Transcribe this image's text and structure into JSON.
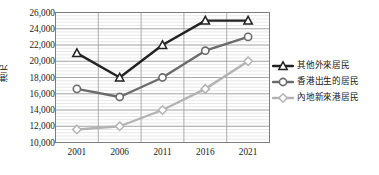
{
  "chart_data": {
    "type": "line",
    "title": "",
    "xlabel": "",
    "ylabel": "港元",
    "categories": [
      "2001",
      "2006",
      "2011",
      "2016",
      "2021"
    ],
    "ylim": [
      10000,
      26000
    ],
    "ytick_step": 2000,
    "yticks": [
      "26,000",
      "24,000",
      "22,000",
      "20,000",
      "18,000",
      "16,000",
      "14,000",
      "12,000",
      "10,000"
    ],
    "ytick_values": [
      26000,
      24000,
      22000,
      20000,
      18000,
      16000,
      14000,
      12000,
      10000
    ],
    "grid": true,
    "minor_grid": true,
    "legend_position": "right",
    "series": [
      {
        "name": "其他外來居民",
        "color": "#222222",
        "marker": "triangle",
        "values": [
          21000,
          18000,
          22000,
          25000,
          25000
        ]
      },
      {
        "name": "香港出生的居民",
        "color": "#6b6b6b",
        "marker": "circle",
        "values": [
          16600,
          15600,
          18000,
          21300,
          23000
        ]
      },
      {
        "name": "內地新來港居民",
        "color": "#b3b3b3",
        "marker": "diamond",
        "values": [
          11600,
          12000,
          14000,
          16600,
          20000
        ]
      }
    ]
  }
}
